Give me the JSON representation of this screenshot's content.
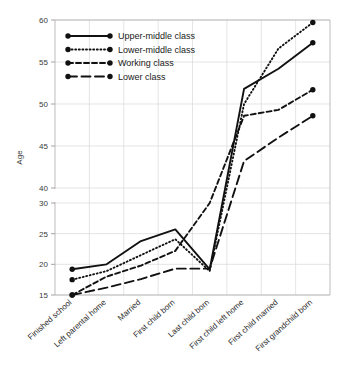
{
  "chart_data": {
    "type": "line",
    "title": "",
    "xlabel": "",
    "ylabel": "Age",
    "ylim": [
      15,
      60
    ],
    "yticks": [
      15,
      20,
      25,
      30,
      40,
      45,
      50,
      55,
      60
    ],
    "axis_break": {
      "present": true,
      "between": [
        30,
        40
      ]
    },
    "grid": true,
    "legend_position": "upper-left",
    "categories": [
      "Finished school",
      "Left parental home",
      "Married",
      "First child born",
      "Last child born",
      "First child left home",
      "First child married",
      "First grandchild born"
    ],
    "series": [
      {
        "name": "Upper-middle class",
        "style": "solid",
        "color": "#111111",
        "values": [
          19.2,
          20.0,
          23.8,
          25.7,
          30.3,
          51.8,
          54.2,
          57.3
        ]
      },
      {
        "name": "Lower-middle class",
        "style": "dotted",
        "color": "#111111",
        "values": [
          17.5,
          18.9,
          21.5,
          24.1,
          30.1,
          50.0,
          56.6,
          59.7
        ]
      },
      {
        "name": "Working class",
        "style": "dashed",
        "color": "#111111",
        "values": [
          15.0,
          18.0,
          19.8,
          22.2,
          30.0,
          48.6,
          49.3,
          51.7
        ]
      },
      {
        "name": "Lower class",
        "style": "longdash",
        "color": "#111111",
        "values": [
          15.0,
          16.2,
          17.6,
          19.3,
          19.3,
          43.2,
          46.0,
          48.6
        ]
      }
    ]
  },
  "legend": {
    "items": [
      {
        "label": "Upper-middle class"
      },
      {
        "label": "Lower-middle class"
      },
      {
        "label": "Working class"
      },
      {
        "label": "Lower class"
      }
    ]
  }
}
